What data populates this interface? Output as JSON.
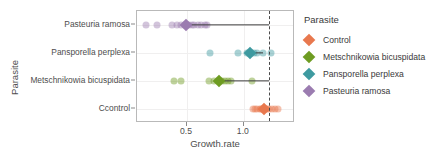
{
  "chart_data": {
    "type": "scatter",
    "title": "",
    "xlabel": "Growth.rate",
    "ylabel": "Parasite",
    "xlim": [
      0.06,
      1.45
    ],
    "xticks": [
      0.5,
      1.0
    ],
    "xticklabels": [
      "0.5",
      "1.0"
    ],
    "categories": [
      "Pasteuria ramosa",
      "Pansporella perplexa",
      "Metschnikowia bicuspidata",
      "Ccontrol"
    ],
    "grid": true,
    "legend_position": "right",
    "reference_line": {
      "x": 1.22,
      "style": "dashed",
      "color": "#4a4a4a"
    },
    "series": [
      {
        "name": "Pasteuria ramosa",
        "color": "#9B7CB0",
        "mean": 0.495,
        "ci": [
          0.46,
          1.22
        ],
        "points": [
          0.14,
          0.24,
          0.37,
          0.41,
          0.445,
          0.48,
          0.5,
          0.52,
          0.545,
          0.565,
          0.6,
          0.625,
          0.655,
          0.68
        ]
      },
      {
        "name": "Pansporella perplexa",
        "color": "#3E9AA0",
        "mean": 1.055,
        "ci": [
          1.04,
          1.17
        ],
        "points": [
          0.7,
          0.95,
          1.03,
          1.06,
          1.09,
          1.12,
          1.17,
          1.24
        ]
      },
      {
        "name": "Metschnikowia bicuspidata",
        "color": "#6E9C22",
        "mean": 0.785,
        "ci": [
          0.75,
          1.22
        ],
        "points": [
          0.385,
          0.45,
          0.695,
          0.735,
          0.775,
          0.81,
          0.835,
          0.86,
          0.885,
          1.07
        ]
      },
      {
        "name": "Ccontrol",
        "color": "#E8784E",
        "mean": 1.175,
        "ci": [
          1.15,
          1.2
        ],
        "points": [
          1.08,
          1.1,
          1.12,
          1.14,
          1.155,
          1.175,
          1.19,
          1.205,
          1.22,
          1.245,
          1.27,
          1.3
        ]
      }
    ]
  },
  "legend": {
    "title": "Parasite",
    "items": [
      {
        "label": "Control",
        "color": "#E8784E"
      },
      {
        "label": "Metschnikowia bicuspidata",
        "color": "#6E9C22"
      },
      {
        "label": "Pansporella perplexa",
        "color": "#3E9AA0"
      },
      {
        "label": "Pasteuria ramosa",
        "color": "#9B7CB0"
      }
    ]
  },
  "axes": {
    "y_title": "Parasite",
    "x_title": "Growth.rate",
    "y_tick_labels": [
      "Pasteuria ramosa",
      "Pansporella perplexa",
      "Metschnikowia bicuspidata",
      "Ccontrol"
    ],
    "x_tick_labels": [
      "0.5",
      "1.0"
    ]
  }
}
